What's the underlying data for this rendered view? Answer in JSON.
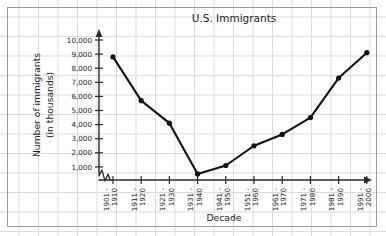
{
  "chart_data": {
    "type": "line",
    "title": "U.S. Immigrants",
    "xlabel": "Decade",
    "ylabel": "Number of immigrants\n(in thousands)",
    "ylabel_line1": "Number of immigrants",
    "ylabel_line2": "(in thousands)",
    "categories": [
      "1901 -\n1910",
      "1911 -\n1920",
      "1921 -\n1930",
      "1931 -\n1940",
      "1941 -\n1950",
      "1951 -\n1960",
      "1961 -\n1970",
      "1971 -\n1980",
      "1981 -\n1990",
      "1991 -\n2000"
    ],
    "category_parts": [
      {
        "start": "1901 -",
        "end": "1910"
      },
      {
        "start": "1911 -",
        "end": "1920"
      },
      {
        "start": "1921 -",
        "end": "1930"
      },
      {
        "start": "1931 -",
        "end": "1940"
      },
      {
        "start": "1941 -",
        "end": "1950"
      },
      {
        "start": "1951 -",
        "end": "1960"
      },
      {
        "start": "1961 -",
        "end": "1970"
      },
      {
        "start": "1971 -",
        "end": "1980"
      },
      {
        "start": "1981 -",
        "end": "1990"
      },
      {
        "start": "1991 -",
        "end": "2000"
      }
    ],
    "values": [
      8800,
      5700,
      4100,
      500,
      1100,
      2500,
      3300,
      4500,
      7300,
      9100
    ],
    "ylim": [
      0,
      10000
    ],
    "ytick_values": [
      1000,
      2000,
      3000,
      4000,
      5000,
      6000,
      7000,
      8000,
      9000,
      10000
    ],
    "ytick_labels": [
      "1,000",
      "2,000",
      "3,000",
      "4,000",
      "5,000",
      "6,000",
      "7,000",
      "8,000",
      "9,000",
      "10,000"
    ],
    "grid": true,
    "legend": "none",
    "y_axis_break": true,
    "marker": "filled-circle",
    "line_color": "#111111",
    "grid_color": "#dcdcdc",
    "axis_color": "#2a2a2a"
  },
  "figure": {
    "background_color": "#ffffff",
    "border_color": "#9a9a9a"
  }
}
